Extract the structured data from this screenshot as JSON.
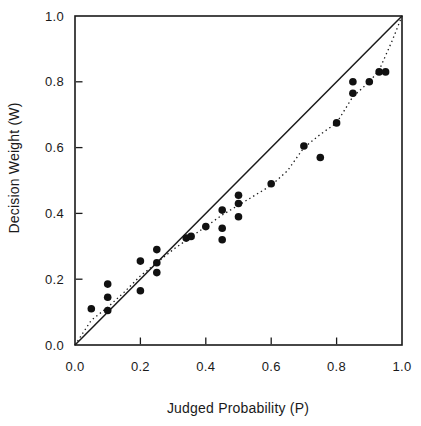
{
  "chart_data": {
    "type": "scatter",
    "title": "",
    "xlabel": "Judged Probability (P)",
    "ylabel": "Decision Weight (W)",
    "xlim": [
      0.0,
      1.0
    ],
    "ylim": [
      0.0,
      1.0
    ],
    "x_ticks": [
      "0.0",
      "0.2",
      "0.4",
      "0.6",
      "0.8",
      "1.0"
    ],
    "y_ticks": [
      "0.0",
      "0.2",
      "0.4",
      "0.6",
      "0.8",
      "1.0"
    ],
    "grid": false,
    "legend": "none",
    "ink": "#1a1a1a",
    "series": [
      {
        "name": "observed-decision-weights",
        "marker": "filled-circle",
        "color": "#111111",
        "points": [
          [
            0.05,
            0.11
          ],
          [
            0.1,
            0.105
          ],
          [
            0.1,
            0.145
          ],
          [
            0.1,
            0.185
          ],
          [
            0.2,
            0.165
          ],
          [
            0.2,
            0.255
          ],
          [
            0.25,
            0.22
          ],
          [
            0.25,
            0.25
          ],
          [
            0.25,
            0.29
          ],
          [
            0.34,
            0.325
          ],
          [
            0.355,
            0.33
          ],
          [
            0.4,
            0.36
          ],
          [
            0.45,
            0.32
          ],
          [
            0.45,
            0.355
          ],
          [
            0.45,
            0.41
          ],
          [
            0.5,
            0.39
          ],
          [
            0.5,
            0.43
          ],
          [
            0.5,
            0.455
          ],
          [
            0.6,
            0.49
          ],
          [
            0.7,
            0.605
          ],
          [
            0.75,
            0.57
          ],
          [
            0.8,
            0.675
          ],
          [
            0.85,
            0.765
          ],
          [
            0.85,
            0.8
          ],
          [
            0.9,
            0.8
          ],
          [
            0.93,
            0.83
          ],
          [
            0.95,
            0.83
          ]
        ]
      }
    ],
    "identity_line": {
      "style": "solid",
      "from": [
        0.0,
        0.0
      ],
      "to": [
        1.0,
        1.0
      ]
    },
    "fitted_curve": {
      "style": "dotted",
      "points": [
        [
          0.0,
          0.0
        ],
        [
          0.05,
          0.075
        ],
        [
          0.1,
          0.115
        ],
        [
          0.15,
          0.16
        ],
        [
          0.2,
          0.21
        ],
        [
          0.25,
          0.25
        ],
        [
          0.3,
          0.29
        ],
        [
          0.35,
          0.325
        ],
        [
          0.4,
          0.36
        ],
        [
          0.45,
          0.395
        ],
        [
          0.5,
          0.425
        ],
        [
          0.55,
          0.455
        ],
        [
          0.6,
          0.485
        ],
        [
          0.65,
          0.53
        ],
        [
          0.7,
          0.6
        ],
        [
          0.75,
          0.64
        ],
        [
          0.8,
          0.675
        ],
        [
          0.85,
          0.755
        ],
        [
          0.9,
          0.8
        ],
        [
          0.93,
          0.835
        ],
        [
          0.97,
          0.925
        ],
        [
          1.0,
          1.0
        ]
      ]
    }
  }
}
